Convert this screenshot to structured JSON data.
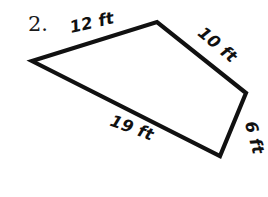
{
  "figure": {
    "problem_number": "2.",
    "background_color": "#ffffff",
    "stroke_color": "#111111",
    "stroke_width": 4.2,
    "shape_type": "quadrilateral",
    "vertices": [
      {
        "name": "left",
        "x": 32,
        "y": 61
      },
      {
        "name": "top",
        "x": 157,
        "y": 22
      },
      {
        "name": "right",
        "x": 246,
        "y": 93
      },
      {
        "name": "bottom",
        "x": 220,
        "y": 156
      }
    ],
    "polygon_points": "32,61 157,22 246,93 220,156",
    "edges": [
      {
        "id": "edge-top-left",
        "label": "12 ft",
        "value": 12,
        "unit": "ft",
        "from": "left",
        "to": "top",
        "label_x": 93,
        "label_y": 28,
        "label_rotation": -13
      },
      {
        "id": "edge-top-right",
        "label": "10 ft",
        "value": 10,
        "unit": "ft",
        "from": "top",
        "to": "right",
        "label_x": 214,
        "label_y": 49,
        "label_rotation": 40
      },
      {
        "id": "edge-right",
        "label": "6 ft",
        "value": 6,
        "unit": "ft",
        "from": "right",
        "to": "bottom",
        "label_x": 249,
        "label_y": 139,
        "label_rotation": 75
      },
      {
        "id": "edge-bottom",
        "label": "19 ft",
        "value": 19,
        "unit": "ft",
        "from": "bottom",
        "to": "left",
        "label_x": 130,
        "label_y": 133,
        "label_rotation": 20
      }
    ],
    "problem_number_x": 28,
    "problem_number_y": 31
  }
}
